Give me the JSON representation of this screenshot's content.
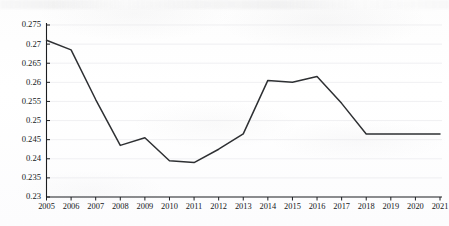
{
  "chart_data": {
    "type": "line",
    "title": "",
    "subtitle": "",
    "xlabel": "",
    "ylabel": "",
    "categories": [
      "2005",
      "2006",
      "2007",
      "2008",
      "2009",
      "2010",
      "2011",
      "2012",
      "2013",
      "2014",
      "2015",
      "2016",
      "2017",
      "2018",
      "2019",
      "2020",
      "2021"
    ],
    "values": [
      0.271,
      0.2685,
      0.2555,
      0.2435,
      0.2455,
      0.2395,
      0.239,
      0.2425,
      0.2465,
      0.2605,
      0.26,
      0.2615,
      0.2545,
      0.2465,
      0.2465,
      0.2465,
      0.2465
    ],
    "series": [
      {
        "name": "",
        "values": [
          0.271,
          0.2685,
          0.2555,
          0.2435,
          0.2455,
          0.2395,
          0.239,
          0.2425,
          0.2465,
          0.2605,
          0.26,
          0.2615,
          0.2545,
          0.2465,
          0.2465,
          0.2465,
          0.2465
        ]
      }
    ],
    "ylim": [
      0.23,
      0.275
    ],
    "ytick_step": 0.005,
    "ytick_labels": [
      "0.275",
      "0.27",
      "0.265",
      "0.26",
      "0.255",
      "0.25",
      "0.245",
      "0.24",
      "0.235",
      "0.23"
    ],
    "ytick_values": [
      0.275,
      0.27,
      0.265,
      0.26,
      0.255,
      0.25,
      0.245,
      0.24,
      0.235,
      0.23
    ],
    "xlim": [
      2005,
      2021
    ],
    "grid": "faint-horizontal",
    "legend": "none",
    "markers": "none",
    "line_color": "#2e3033",
    "axis_color": "#1b1d20",
    "background_color": "#ffffff"
  }
}
